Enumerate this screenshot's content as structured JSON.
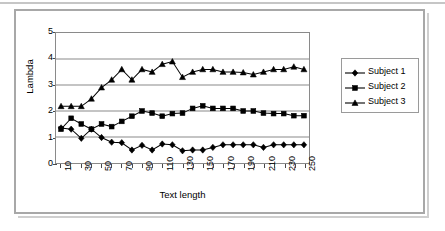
{
  "chart_data": {
    "type": "line",
    "title": "",
    "xlabel": "Text length",
    "ylabel": "Lambda",
    "xlim": [
      0,
      260
    ],
    "ylim": [
      0,
      5
    ],
    "grid": true,
    "legend_position": "right",
    "y_ticks": [
      0,
      1,
      2,
      3,
      4,
      5
    ],
    "x_tick_labels": [
      "10",
      "30",
      "50",
      "70",
      "90",
      "110",
      "130",
      "150",
      "170",
      "190",
      "210",
      "230",
      "250"
    ],
    "x": [
      10,
      20,
      30,
      40,
      50,
      60,
      70,
      80,
      90,
      100,
      110,
      120,
      130,
      140,
      150,
      160,
      170,
      180,
      190,
      200,
      210,
      220,
      230,
      240,
      250
    ],
    "series": [
      {
        "name": "Subject 1",
        "marker": "diamond",
        "values": [
          1.35,
          1.3,
          0.95,
          1.3,
          0.98,
          0.8,
          0.78,
          0.5,
          0.68,
          0.5,
          0.73,
          0.7,
          0.47,
          0.5,
          0.5,
          0.6,
          0.7,
          0.7,
          0.7,
          0.7,
          0.6,
          0.7,
          0.7,
          0.7,
          0.7
        ]
      },
      {
        "name": "Subject 2",
        "marker": "square",
        "values": [
          1.3,
          1.72,
          1.5,
          1.3,
          1.5,
          1.4,
          1.6,
          1.8,
          2.0,
          1.92,
          1.8,
          1.9,
          1.92,
          2.1,
          2.2,
          2.1,
          2.1,
          2.1,
          2.0,
          2.0,
          1.92,
          1.9,
          1.9,
          1.82,
          1.82
        ]
      },
      {
        "name": "Subject 3",
        "marker": "triangle",
        "values": [
          2.18,
          2.18,
          2.18,
          2.47,
          2.9,
          3.2,
          3.6,
          3.2,
          3.6,
          3.5,
          3.8,
          3.9,
          3.3,
          3.5,
          3.6,
          3.6,
          3.5,
          3.5,
          3.48,
          3.4,
          3.5,
          3.6,
          3.6,
          3.7,
          3.6
        ]
      }
    ]
  },
  "legend": {
    "items": [
      {
        "label": "Subject 1",
        "marker": "diamond"
      },
      {
        "label": "Subject 2",
        "marker": "square"
      },
      {
        "label": "Subject 3",
        "marker": "triangle"
      }
    ]
  },
  "colors": {
    "series_line": "#000000",
    "grid": "#8a8a8a",
    "frame": "#8a8a8a",
    "outer_frame": "#a8a8a8",
    "text": "#000000"
  }
}
